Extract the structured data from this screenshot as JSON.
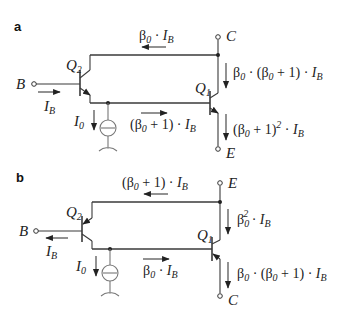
{
  "figure": {
    "panels": [
      {
        "id": "a",
        "label": "a",
        "terminals": {
          "base": "B",
          "top": "C",
          "bottom": "E"
        },
        "transistors": {
          "left": {
            "name": "Q",
            "sub": "2"
          },
          "right": {
            "name": "Q",
            "sub": "1"
          }
        },
        "currents": {
          "base_input": {
            "sym": "I",
            "sub": "B",
            "direction": "right"
          },
          "top_wire": {
            "pre": "β",
            "pre_sub": "0",
            "mid": " · ",
            "sym": "I",
            "sub": "B",
            "direction": "left"
          },
          "bias": {
            "sym": "I",
            "sub": "0",
            "direction": "down"
          },
          "bottom_wire": {
            "text1": "(β",
            "sub1": "0",
            "text2": " + 1) · ",
            "sym": "I",
            "sub": "B",
            "direction": "right"
          },
          "right_upper": {
            "text1": "β",
            "sub1": "0",
            "text2": " · (β",
            "sub2": "0",
            "text3": " + 1) · ",
            "sym": "I",
            "sub": "B",
            "direction": "down"
          },
          "right_lower": {
            "text1": "(β",
            "sub1": "0",
            "text2": " + 1)",
            "sup": "2",
            "text3": " · ",
            "sym": "I",
            "sub": "B",
            "direction": "down"
          }
        }
      },
      {
        "id": "b",
        "label": "b",
        "terminals": {
          "base": "B",
          "top": "E",
          "bottom": "C"
        },
        "transistors": {
          "left": {
            "name": "Q",
            "sub": "2"
          },
          "right": {
            "name": "Q",
            "sub": "1"
          }
        },
        "currents": {
          "base_input": {
            "sym": "I",
            "sub": "B",
            "direction": "left"
          },
          "top_wire": {
            "text1": "(β",
            "sub1": "0",
            "text2": " + 1) · ",
            "sym": "I",
            "sub": "B",
            "direction": "left"
          },
          "bias": {
            "sym": "I",
            "sub": "0",
            "direction": "down"
          },
          "bottom_wire": {
            "pre": "β",
            "pre_sub": "0",
            "mid": " · ",
            "sym": "I",
            "sub": "B",
            "direction": "right"
          },
          "right_upper": {
            "text1": "β",
            "sub1": "0",
            "sup": "2",
            "text3": " · ",
            "sym": "I",
            "sub": "B",
            "direction": "down"
          },
          "right_lower": {
            "text1": "β",
            "sub1": "0",
            "text2": " · (β",
            "sub2": "0",
            "text3": " + 1) · ",
            "sym": "I",
            "sub": "B",
            "direction": "down"
          }
        }
      }
    ]
  }
}
